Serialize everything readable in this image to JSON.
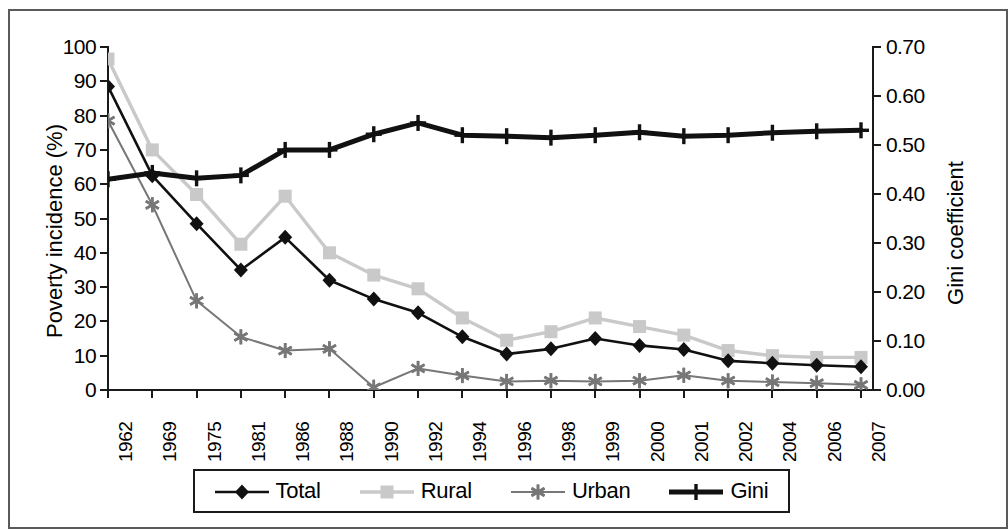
{
  "chart_data": {
    "type": "line",
    "title": "",
    "xlabel": "",
    "ylabel": "Poverty incidence (%)",
    "y2label": "Gini coefficient",
    "ylim": [
      0,
      100
    ],
    "y2lim": [
      0.0,
      0.7
    ],
    "ytick_labels": [
      "0",
      "10",
      "20",
      "30",
      "40",
      "50",
      "60",
      "70",
      "80",
      "90",
      "100"
    ],
    "ytick_values": [
      0,
      10,
      20,
      30,
      40,
      50,
      60,
      70,
      80,
      90,
      100
    ],
    "y2tick_labels": [
      "0.00",
      "0.10",
      "0.20",
      "0.30",
      "0.40",
      "0.50",
      "0.60",
      "0.70"
    ],
    "y2tick_values": [
      0.0,
      0.1,
      0.2,
      0.3,
      0.4,
      0.5,
      0.6,
      0.7
    ],
    "grid": false,
    "legend_position": "bottom",
    "categories": [
      "1962",
      "1969",
      "1975",
      "1981",
      "1986",
      "1988",
      "1990",
      "1992",
      "1994",
      "1996",
      "1998",
      "1999",
      "2000",
      "2001",
      "2002",
      "2004",
      "2006",
      "2007"
    ],
    "series": [
      {
        "name": "Total",
        "axis": "left",
        "marker": "diamond",
        "color": "#111111",
        "line_width": 2.6,
        "values": [
          88.5,
          62.5,
          48.5,
          35.0,
          44.5,
          32.0,
          26.5,
          22.5,
          15.5,
          10.5,
          12.0,
          15.0,
          13.0,
          11.8,
          8.5,
          7.8,
          7.2,
          6.8
        ]
      },
      {
        "name": "Rural",
        "axis": "left",
        "marker": "square",
        "color": "#c9c9c9",
        "line_width": 3.4,
        "values": [
          96.5,
          70.0,
          57.0,
          42.5,
          56.5,
          40.0,
          33.5,
          29.5,
          21.0,
          14.5,
          17.0,
          21.0,
          18.5,
          16.0,
          11.5,
          10.0,
          9.5,
          9.5
        ]
      },
      {
        "name": "Urban",
        "axis": "left",
        "marker": "star",
        "color": "#777777",
        "line_width": 2.0,
        "values": [
          78.5,
          54.0,
          26.0,
          15.5,
          11.5,
          12.0,
          0.8,
          6.3,
          4.2,
          2.5,
          2.7,
          2.5,
          2.7,
          4.3,
          2.7,
          2.3,
          2.0,
          1.5
        ]
      },
      {
        "name": "Gini",
        "axis": "right",
        "marker": "plus",
        "color": "#111111",
        "line_width": 5.0,
        "values": [
          0.43,
          0.443,
          0.432,
          0.438,
          0.49,
          0.49,
          0.522,
          0.545,
          0.52,
          0.518,
          0.515,
          0.52,
          0.526,
          0.518,
          0.52,
          0.525,
          0.528,
          0.53
        ]
      }
    ]
  },
  "legend": {
    "items": [
      {
        "label": "Total",
        "marker": "diamond-marker"
      },
      {
        "label": "Rural",
        "marker": "square-marker"
      },
      {
        "label": "Urban",
        "marker": "asterisk-marker"
      },
      {
        "label": "Gini",
        "marker": "plus-marker"
      }
    ]
  },
  "colors": {
    "total": "#111111",
    "rural": "#c9c9c9",
    "urban": "#777777",
    "gini": "#111111",
    "axis": "#1a1a1a",
    "frame": "#5a5a5a",
    "background": "#ffffff"
  }
}
